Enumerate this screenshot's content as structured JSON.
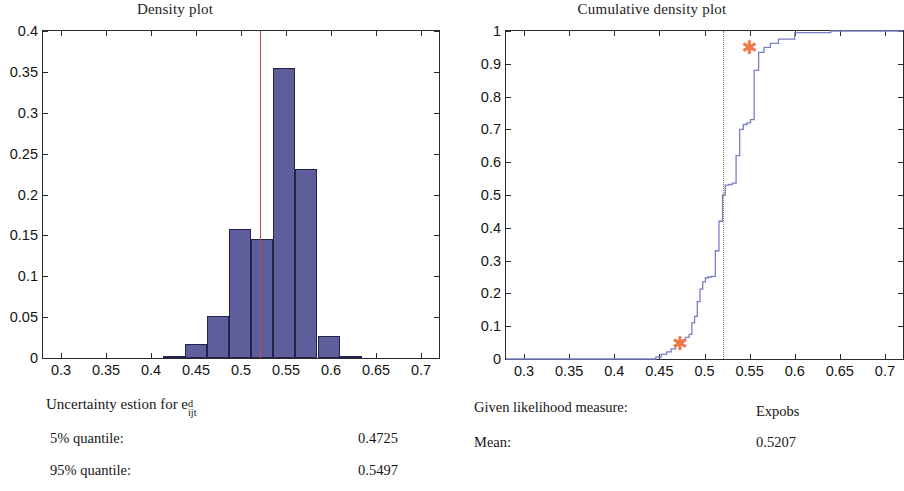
{
  "figure": {
    "panels": [
      {
        "id": "density",
        "title": "Density plot"
      },
      {
        "id": "cumulative",
        "title": "Cumulative density plot"
      }
    ]
  },
  "left_caption": {
    "heading_prefix": "Uncertainty estion for e",
    "heading_sup": "d",
    "heading_sub": "ijt",
    "rows": [
      {
        "label": "5% quantile:",
        "value": "0.4725"
      },
      {
        "label": "95% quantile:",
        "value": "0.5497"
      }
    ]
  },
  "right_caption": {
    "rows": [
      {
        "label": "Given likelihood measure:",
        "value": "Expobs"
      },
      {
        "label": "Mean:",
        "value": "0.5207"
      }
    ]
  },
  "colors": {
    "bar_fill": "#5f5e9c",
    "bar_edge": "#23224a",
    "mean_line": "#b2504c",
    "cdf_line": "#7b7fc4",
    "marker": "#f0794a",
    "axis": "#2b2b2b",
    "dotted_line": "#7a7a55"
  },
  "chart_data": [
    {
      "type": "bar",
      "id": "density-histogram",
      "title": "Density plot",
      "xlabel": "",
      "ylabel": "",
      "xlim": [
        0.28,
        0.72
      ],
      "ylim": [
        0,
        0.4
      ],
      "xticks": [
        0.3,
        0.35,
        0.4,
        0.45,
        0.5,
        0.55,
        0.6,
        0.65,
        0.7
      ],
      "xtick_labels": [
        "0.3",
        "0.35",
        "0.4",
        "0.45",
        "0.5",
        "0.55",
        "0.6",
        "0.65",
        "0.7"
      ],
      "yticks": [
        0,
        0.05,
        0.1,
        0.15,
        0.2,
        0.25,
        0.3,
        0.35,
        0.4
      ],
      "ytick_labels": [
        "0",
        "0.05",
        "0.1",
        "0.15",
        "0.2",
        "0.25",
        "0.3",
        "0.35",
        "0.4"
      ],
      "grid": false,
      "legend": false,
      "bin_width": 0.0245,
      "bins": [
        {
          "left": 0.4135,
          "right": 0.438,
          "value": 0.002
        },
        {
          "left": 0.438,
          "right": 0.4625,
          "value": 0.017
        },
        {
          "left": 0.4625,
          "right": 0.487,
          "value": 0.051
        },
        {
          "left": 0.487,
          "right": 0.5115,
          "value": 0.158
        },
        {
          "left": 0.5115,
          "right": 0.536,
          "value": 0.145
        },
        {
          "left": 0.536,
          "right": 0.5605,
          "value": 0.355
        },
        {
          "left": 0.5605,
          "right": 0.585,
          "value": 0.231
        },
        {
          "left": 0.585,
          "right": 0.6095,
          "value": 0.027
        },
        {
          "left": 0.6095,
          "right": 0.634,
          "value": 0.003
        }
      ],
      "annotations": [
        {
          "type": "vline",
          "x": 0.5207,
          "label": "mean",
          "color": "#b2504c"
        }
      ]
    },
    {
      "type": "line",
      "id": "cumulative-density",
      "title": "Cumulative density plot",
      "xlabel": "",
      "ylabel": "",
      "xlim": [
        0.28,
        0.72
      ],
      "ylim": [
        0,
        1
      ],
      "xticks": [
        0.3,
        0.35,
        0.4,
        0.45,
        0.5,
        0.55,
        0.6,
        0.65,
        0.7
      ],
      "xtick_labels": [
        "0.3",
        "0.35",
        "0.4",
        "0.45",
        "0.5",
        "0.55",
        "0.6",
        "0.65",
        "0.7"
      ],
      "yticks": [
        0,
        0.1,
        0.2,
        0.3,
        0.4,
        0.5,
        0.6,
        0.7,
        0.8,
        0.9,
        1
      ],
      "ytick_labels": [
        "0",
        "0.1",
        "0.2",
        "0.3",
        "0.4",
        "0.5",
        "0.6",
        "0.7",
        "0.8",
        "0.9",
        "1"
      ],
      "grid": false,
      "legend": false,
      "series": [
        {
          "name": "empirical CDF",
          "step": true,
          "color": "#7b7fc4",
          "x": [
            0.28,
            0.437,
            0.446,
            0.452,
            0.458,
            0.463,
            0.468,
            0.472,
            0.476,
            0.479,
            0.483,
            0.486,
            0.489,
            0.492,
            0.495,
            0.498,
            0.501,
            0.504,
            0.508,
            0.512,
            0.516,
            0.52,
            0.523,
            0.527,
            0.531,
            0.535,
            0.539,
            0.543,
            0.547,
            0.551,
            0.555,
            0.56,
            0.566,
            0.573,
            0.582,
            0.6,
            0.64,
            0.72
          ],
          "y": [
            0.0,
            0.0,
            0.006,
            0.014,
            0.022,
            0.031,
            0.042,
            0.05,
            0.058,
            0.066,
            0.075,
            0.11,
            0.13,
            0.175,
            0.213,
            0.235,
            0.247,
            0.25,
            0.252,
            0.33,
            0.42,
            0.5,
            0.53,
            0.532,
            0.536,
            0.62,
            0.7,
            0.715,
            0.72,
            0.73,
            0.88,
            0.935,
            0.95,
            0.962,
            0.975,
            0.995,
            1.0,
            1.0
          ]
        }
      ],
      "annotations": [
        {
          "type": "vline",
          "x": 0.5207,
          "style": "dotted",
          "color": "#7a7a55"
        },
        {
          "type": "marker",
          "x": 0.4725,
          "y": 0.05,
          "symbol": "asterisk",
          "color": "#f0794a",
          "label": "5% quantile"
        },
        {
          "type": "marker",
          "x": 0.5497,
          "y": 0.95,
          "symbol": "asterisk",
          "color": "#f0794a",
          "label": "95% quantile"
        }
      ]
    }
  ]
}
